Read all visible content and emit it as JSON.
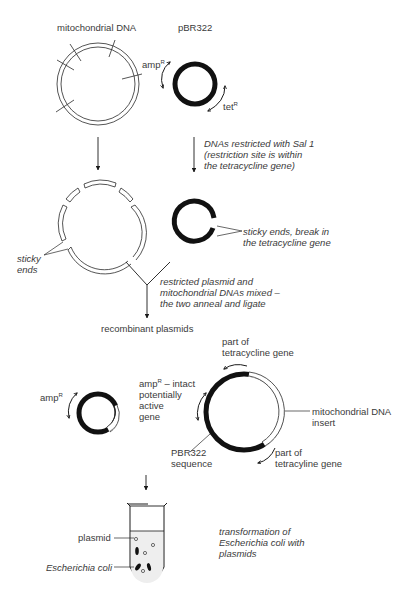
{
  "diagram": {
    "colors": {
      "ink": "#1a1a1a",
      "text": "#3a3a3a",
      "background": "#ffffff"
    },
    "step1": {
      "mito_label": "mitochondrial DNA",
      "plasmid_label": "pBR322",
      "amp_label": "amp",
      "amp_sup": "R",
      "tet_label": "tet",
      "tet_sup": "R"
    },
    "step2": {
      "caption_line1": "DNAs restricted with Sal 1",
      "caption_line2": "(restriction site is within",
      "caption_line3": "the tetracycline gene)",
      "sticky_ends_label_line1": "sticky",
      "sticky_ends_label_line2": "ends",
      "plasmid_break_line1": "sticky ends, break in",
      "plasmid_break_line2": "the tetracycline gene"
    },
    "step3": {
      "caption_line1": "restricted plasmid and",
      "caption_line2": "mitochondrial DNAs mixed –",
      "caption_line3": "the two anneal and ligate",
      "result_label": "recombinant plasmids"
    },
    "step4": {
      "small_amp_label": "amp",
      "small_amp_sup": "R",
      "tet_part_top_line1": "part of",
      "tet_part_top_line2": "tetracycline gene",
      "amp_intact_line1_a": "amp",
      "amp_intact_sup": "R",
      "amp_intact_line1_b": " – intact",
      "amp_intact_line2": "potentially",
      "amp_intact_line3": "active",
      "amp_intact_line4": "gene",
      "insert_line1": "mitochondrial DNA",
      "insert_line2": "insert",
      "pbr_seq_line1": "PBR322",
      "pbr_seq_line2": "sequence",
      "tet_part_bottom_line1": "part of",
      "tet_part_bottom_line2": "tetracyline gene"
    },
    "step5": {
      "plasmid_label": "plasmid",
      "ecoli_label": "Escherichia coli",
      "caption_line1": "transformation of",
      "caption_line2": "Escherichia coli with",
      "caption_line3": "plasmids"
    }
  }
}
